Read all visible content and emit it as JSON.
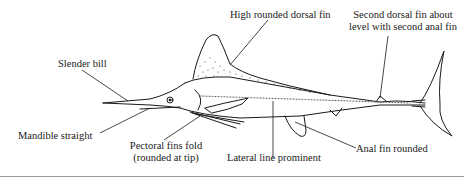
{
  "diagram": {
    "line_color": "#1a1a1a",
    "rule_color": "#9a9a9a",
    "labels": {
      "dorsal_fin": "High rounded dorsal fin",
      "second_dorsal_line1": "Second dorsal fin about",
      "second_dorsal_line2": "level with second anal fin",
      "bill": "Slender bill",
      "mandible": "Mandible straight",
      "pectoral_line1": "Pectoral fins fold",
      "pectoral_line2": "(rounded at tip)",
      "lateral_line": "Lateral line prominent",
      "anal_fin": "Anal fin rounded"
    }
  }
}
